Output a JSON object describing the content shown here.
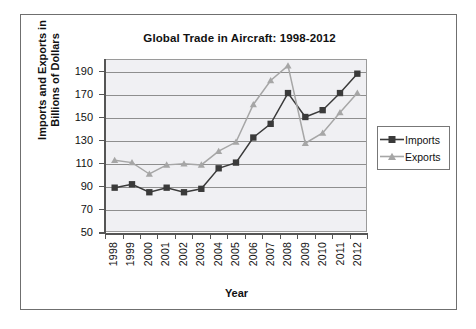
{
  "chart_data": {
    "type": "line",
    "title": "Global Trade in Aircraft: 1998-2012",
    "xlabel": "Year",
    "ylabel": "Imports and Exports in Billions of Dollars",
    "ylabel_line1": "Imports and Exports in",
    "ylabel_line2": "Billions of Dollars",
    "categories": [
      "1998",
      "1999",
      "2000",
      "2001",
      "2002",
      "2003",
      "2004",
      "2005",
      "2006",
      "2007",
      "2008",
      "2009",
      "2010",
      "2011",
      "2012"
    ],
    "series": [
      {
        "name": "Imports",
        "marker": "square",
        "color": "#3a3a3a",
        "values": [
          88,
          91,
          84,
          88,
          84,
          87,
          105,
          110,
          132,
          144,
          171,
          150,
          156,
          171,
          188
        ]
      },
      {
        "name": "Exports",
        "marker": "triangle",
        "color": "#a6a6a6",
        "values": [
          112,
          110,
          100,
          108,
          109,
          108,
          120,
          128,
          161,
          182,
          195,
          127,
          136,
          154,
          171
        ]
      }
    ],
    "ylim": [
      50,
      200
    ],
    "yticks": [
      50,
      70,
      90,
      110,
      130,
      150,
      170,
      190
    ],
    "ytick_labels": [
      "50",
      "70",
      "90",
      "110",
      "130",
      "150",
      "170",
      "190"
    ],
    "grid": "horizontal",
    "legend_position": "right",
    "plot_background": "#f0f0f3",
    "frame_color": "#6f6f6f"
  },
  "legend": {
    "entries": [
      {
        "label": "Imports"
      },
      {
        "label": "Exports"
      }
    ]
  }
}
